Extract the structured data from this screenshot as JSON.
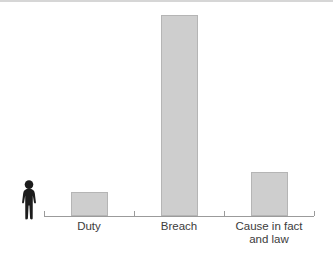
{
  "figure": {
    "background": "#ffffff",
    "top_rule_color": "#d6d6d6"
  },
  "icons": {
    "person_icon": {
      "name": "person-icon",
      "color": "#1c1c1c"
    }
  },
  "chart_data": {
    "type": "bar",
    "title": "",
    "xlabel": "",
    "ylabel": "",
    "categories": [
      "Duty",
      "Breach",
      "Cause in fact\nand law"
    ],
    "values": [
      12,
      100,
      22
    ],
    "value_unit": "relative bar height (Breach = 100)",
    "ylim": [
      0,
      100
    ],
    "grid": false,
    "legend": "none",
    "bar_color": "#cecece",
    "bar_border_color": "#b5b5b5",
    "axis_color": "#9b9b9b",
    "label_color": "#3c3c3c"
  }
}
